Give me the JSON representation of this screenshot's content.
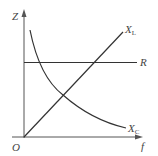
{
  "diagram": {
    "type": "impedance-vs-frequency",
    "axes": {
      "y_label": "Z",
      "x_label": "f",
      "origin_label": "O"
    },
    "curves": [
      {
        "id": "xl",
        "label_main": "X",
        "label_sub": "L",
        "shape": "straight line through origin, increasing"
      },
      {
        "id": "r",
        "label_main": "R",
        "label_sub": "",
        "shape": "horizontal line, constant"
      },
      {
        "id": "xc",
        "label_main": "X",
        "label_sub": "C",
        "shape": "hyperbola, decreasing"
      }
    ],
    "colors": {
      "line": "#333333",
      "axis": "#555555",
      "text": "#444444"
    }
  }
}
